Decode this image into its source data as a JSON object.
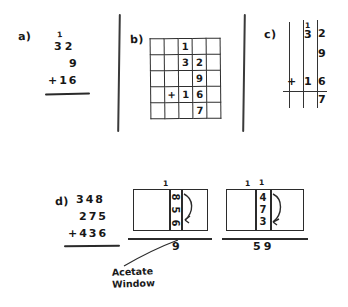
{
  "page": {
    "background": "#ffffff",
    "ink": "#1a1a1a"
  },
  "sections": {
    "a": {
      "label": "a)",
      "carry": "1",
      "addend1": "32",
      "addend2": "9",
      "addend3": "+16",
      "rule": true
    },
    "b": {
      "label": "b)",
      "grid": {
        "rows": 5,
        "cols": 5,
        "cells": [
          [
            "",
            "",
            "1",
            "",
            ""
          ],
          [
            "",
            "",
            "3",
            "2",
            ""
          ],
          [
            "",
            "",
            "",
            "9",
            ""
          ],
          [
            "",
            "+",
            "1",
            "6",
            ""
          ],
          [
            "",
            "",
            "",
            "7",
            ""
          ]
        ]
      }
    },
    "c": {
      "label": "c)",
      "columns": [
        {
          "digits": [
            "",
            "",
            "+",
            ""
          ]
        },
        {
          "digits": [
            "1",
            "3",
            "1",
            ""
          ]
        },
        {
          "digits": [
            "2",
            "9",
            "6",
            "7"
          ]
        }
      ],
      "flat_digits": {
        "carry": "1",
        "tens": "3",
        "ones": "2",
        "second": "9",
        "plus": "+",
        "third_tens": "1",
        "third_ones": "6",
        "answer": "7"
      }
    },
    "d": {
      "label": "d)",
      "addend1": "348",
      "addend2": "275",
      "addend3": "+436",
      "rule": true,
      "caption": "Acetate\nWindow",
      "caption_line1": "Acetate",
      "caption_line2": "Window",
      "window_left": {
        "carry_top": "1",
        "column_digits": [
          "8",
          "5",
          "6"
        ],
        "result": "9",
        "has_arrow": true
      },
      "window_right": {
        "carry_top_left": "1",
        "carry_top_right": "1",
        "column_digits": [
          "4",
          "7",
          "3"
        ],
        "result": "59",
        "has_arrow": true
      }
    }
  }
}
